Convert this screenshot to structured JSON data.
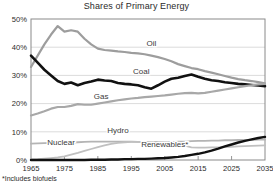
{
  "chart_data": {
    "type": "line",
    "title": "Shares of Primary Energy",
    "footnote": "*Includes biofuels",
    "xlabel": "",
    "ylabel": "",
    "xlim": [
      1965,
      2035
    ],
    "ylim": [
      0,
      50
    ],
    "grid": true,
    "legend_position": "inline-labels",
    "x_ticks": [
      1965,
      1975,
      1985,
      1995,
      2005,
      2015,
      2025,
      2035
    ],
    "x_tick_labels": [
      "1965",
      "1975",
      "1985",
      "1995",
      "2005",
      "2015",
      "2025",
      "2035"
    ],
    "y_ticks": [
      0,
      10,
      20,
      30,
      40,
      50
    ],
    "y_tick_labels": [
      "0%",
      "10%",
      "20%",
      "30%",
      "40%",
      "50%"
    ],
    "x": [
      1965,
      1967,
      1969,
      1971,
      1973,
      1975,
      1977,
      1979,
      1981,
      1983,
      1985,
      1987,
      1989,
      1991,
      1993,
      1995,
      1997,
      1999,
      2001,
      2003,
      2005,
      2007,
      2009,
      2011,
      2013,
      2015,
      2017,
      2019,
      2021,
      2023,
      2025,
      2027,
      2029,
      2031,
      2033,
      2035
    ],
    "series": [
      {
        "name": "Oil",
        "color": "#9d9d9d",
        "width": 2.2,
        "label_x": 2001,
        "label_y": 40.5,
        "values": [
          33.0,
          37.0,
          41.0,
          44.5,
          47.5,
          45.5,
          46.0,
          45.5,
          43.0,
          41.0,
          39.5,
          39.0,
          38.8,
          38.5,
          38.3,
          38.0,
          37.8,
          37.5,
          37.0,
          36.5,
          35.8,
          35.0,
          34.0,
          33.3,
          32.6,
          32.2,
          31.5,
          31.0,
          30.4,
          29.8,
          29.2,
          28.7,
          28.3,
          28.0,
          27.6,
          27.2
        ]
      },
      {
        "name": "Coal",
        "color": "#111111",
        "width": 2.6,
        "label_x": 1998,
        "label_y": 30.5,
        "values": [
          37.0,
          34.5,
          32.0,
          30.0,
          28.0,
          27.0,
          27.5,
          26.5,
          27.3,
          27.8,
          28.5,
          28.2,
          28.0,
          27.3,
          27.0,
          26.8,
          26.5,
          25.8,
          25.3,
          26.5,
          27.8,
          28.8,
          29.2,
          29.8,
          30.3,
          29.5,
          28.8,
          28.3,
          28.0,
          27.6,
          27.3,
          27.0,
          26.8,
          26.6,
          26.4,
          26.2
        ]
      },
      {
        "name": "Gas",
        "color": "#a8a8a8",
        "width": 2.2,
        "label_x": 1986,
        "label_y": 21.5,
        "values": [
          15.8,
          16.5,
          17.3,
          18.2,
          18.8,
          18.8,
          19.2,
          19.8,
          19.6,
          19.6,
          20.0,
          20.4,
          20.8,
          21.2,
          21.5,
          21.8,
          22.0,
          22.3,
          22.5,
          22.7,
          22.9,
          23.2,
          23.5,
          23.7,
          23.8,
          23.6,
          23.8,
          24.2,
          24.6,
          25.0,
          25.4,
          25.8,
          26.2,
          26.5,
          26.8,
          27.0
        ]
      },
      {
        "name": "Hydro",
        "color": "#b4b4b4",
        "width": 1.8,
        "label_x": 1991,
        "label_y": 9.4,
        "values": [
          5.8,
          5.9,
          6.0,
          6.1,
          6.1,
          6.2,
          6.2,
          6.3,
          6.4,
          6.5,
          6.5,
          6.5,
          6.5,
          6.5,
          6.5,
          6.5,
          6.4,
          6.4,
          6.4,
          6.4,
          6.3,
          6.3,
          6.5,
          6.5,
          6.7,
          6.8,
          6.8,
          6.9,
          6.9,
          7.0,
          7.0,
          7.1,
          7.1,
          7.1,
          7.2,
          7.2
        ]
      },
      {
        "name": "Nuclear",
        "color": "#c0c0c0",
        "width": 1.8,
        "label_x": 1974,
        "label_y": 5.3,
        "values": [
          0.2,
          0.3,
          0.5,
          0.7,
          0.9,
          1.3,
          1.9,
          2.5,
          3.2,
          3.9,
          4.6,
          5.2,
          5.7,
          6.1,
          6.3,
          6.4,
          6.4,
          6.4,
          6.3,
          6.2,
          6.0,
          5.8,
          5.5,
          5.1,
          4.5,
          4.4,
          4.4,
          4.5,
          4.5,
          4.6,
          4.7,
          4.8,
          4.9,
          5.0,
          5.1,
          5.2
        ]
      },
      {
        "name": "Renewables*",
        "color": "#111111",
        "width": 2.4,
        "label_x": 2005,
        "label_y": 4.6,
        "values": [
          0.0,
          0.0,
          0.0,
          0.0,
          0.0,
          0.0,
          0.0,
          0.0,
          0.0,
          0.1,
          0.1,
          0.1,
          0.2,
          0.2,
          0.3,
          0.3,
          0.4,
          0.4,
          0.5,
          0.6,
          0.7,
          0.9,
          1.1,
          1.4,
          1.8,
          2.2,
          2.7,
          3.3,
          4.0,
          4.8,
          5.5,
          6.2,
          6.8,
          7.3,
          7.8,
          8.2
        ]
      }
    ]
  },
  "figure": {
    "title": "Shares of Primary Energy",
    "footnote": "*Includes biofuels"
  }
}
